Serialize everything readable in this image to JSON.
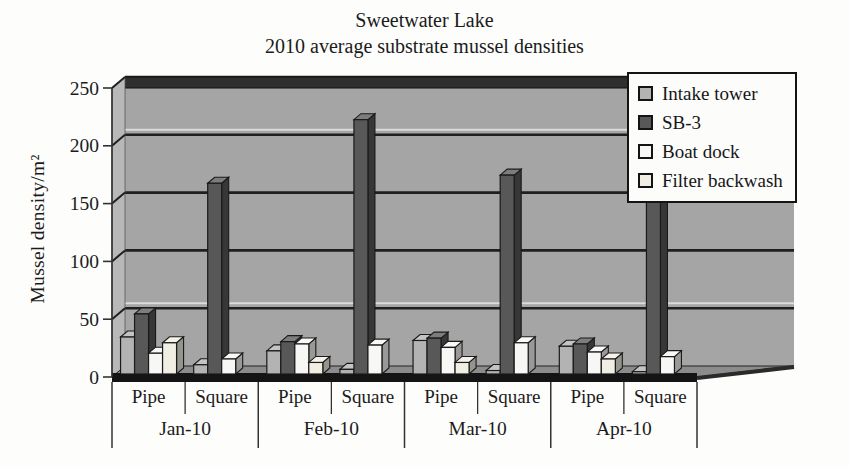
{
  "title": {
    "line1": "Sweetwater Lake",
    "line2": "2010 average substrate mussel densities"
  },
  "chart_data": {
    "type": "bar",
    "style": "3d-clustered-column, grayscale scanned figure",
    "title": "Sweetwater Lake",
    "subtitle": "2010 average substrate mussel densities",
    "xlabel": "",
    "ylabel": "Mussel density/m²",
    "ylim": [
      0,
      250
    ],
    "yticks": [
      0,
      50,
      100,
      150,
      200,
      250
    ],
    "grid": true,
    "legend_position": "top-right overlapping plot",
    "months": [
      "Jan-10",
      "Feb-10",
      "Mar-10",
      "Apr-10"
    ],
    "substrates": [
      "Pipe",
      "Square"
    ],
    "categories": [
      "Jan-10 Pipe",
      "Jan-10 Square",
      "Feb-10 Pipe",
      "Feb-10 Square",
      "Mar-10 Pipe",
      "Mar-10 Square",
      "Apr-10 Pipe",
      "Apr-10 Square"
    ],
    "series": [
      {
        "name": "Intake tower",
        "color": "#b3b3b3",
        "values": [
          32,
          8,
          20,
          4,
          29,
          3,
          24,
          2
        ]
      },
      {
        "name": "SB-3",
        "color": "#585858",
        "values": [
          52,
          165,
          28,
          220,
          31,
          172,
          26,
          150
        ]
      },
      {
        "name": "Boat dock",
        "color": "#f7f7f5",
        "values": [
          18,
          13,
          26,
          25,
          23,
          27,
          19,
          15
        ]
      },
      {
        "name": "Filter backwash",
        "color": "#f1eee3",
        "values": [
          27,
          0,
          10,
          0,
          10,
          0,
          13,
          0
        ]
      }
    ],
    "colors": {
      "wall": "#a5a5a5",
      "left_wall": "#b8b8b8",
      "floor": "#8c8c8c",
      "top_band": "#2f2f2f",
      "gridline": "#1f1f1f",
      "text": "#1b1b1b"
    }
  }
}
